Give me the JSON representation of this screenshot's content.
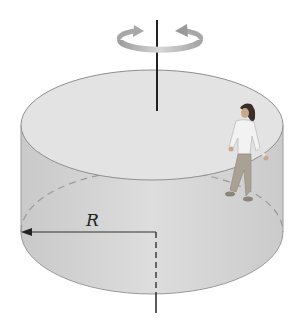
{
  "diagram": {
    "type": "rotating-cylinder",
    "labels": {
      "radius": "R"
    },
    "elements": [
      "rotation-arrow",
      "rotation-axis",
      "cylinder",
      "person",
      "radius-arrow"
    ],
    "colors": {
      "cylinder_fill": "#d2d2d2",
      "cylinder_top_fill": "#e6e6e6",
      "outline": "#9a9a9a",
      "axis": "#222222",
      "rotation_arrow": "#b5b5b5"
    }
  }
}
